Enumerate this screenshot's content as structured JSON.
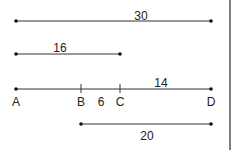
{
  "diagram": {
    "segments": [
      {
        "id": "seg-30",
        "length_label": "30"
      },
      {
        "id": "seg-16",
        "length_label": "16"
      },
      {
        "id": "seg-ad",
        "length_label": "14",
        "points": [
          "A",
          "B",
          "C",
          "D"
        ],
        "bc_label": "6"
      },
      {
        "id": "seg-20",
        "length_label": "20"
      }
    ],
    "point_labels": {
      "a": "A",
      "b": "B",
      "c": "C",
      "d": "D"
    }
  }
}
